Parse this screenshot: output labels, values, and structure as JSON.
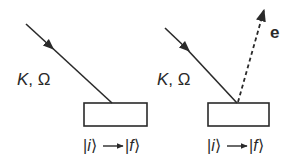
{
  "panels": [
    {
      "id": "absorption",
      "incoming_label_k": "K",
      "incoming_label_sep": ", ",
      "incoming_label_omega": "Ω",
      "transition": {
        "initial_state": "i",
        "final_state": "f"
      },
      "emitted_label": null
    },
    {
      "id": "photoemission",
      "incoming_label_k": "K",
      "incoming_label_sep": ", ",
      "incoming_label_omega": "Ω",
      "transition": {
        "initial_state": "i",
        "final_state": "f"
      },
      "emitted_label": "e"
    }
  ],
  "colors": {
    "ink": "#2a2a2a",
    "background": "#ffffff"
  }
}
